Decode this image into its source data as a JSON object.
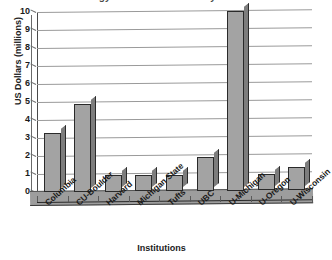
{
  "figure": {
    "title_sliver": "Technology Transfer Revenue by Institution",
    "background_color": "#ffffff",
    "bar_fill_color": "#a3a3a3",
    "bar_side_color": "#7d7d7d",
    "bar_outline_color": "#2a2a2a",
    "gridline_color": "#9a9a9a",
    "floor_color": "#9d9d9d"
  },
  "chart_data": {
    "type": "bar",
    "title": "",
    "xlabel": "Institutions",
    "ylabel": "US Dollars (millions)",
    "categories": [
      "Columbia",
      "CU-Boulder",
      "Harvard",
      "Michigan State",
      "Tufts",
      "UBC",
      "U-Michigan",
      "U-Oregon",
      "U-Wisconsin"
    ],
    "values": [
      3.3,
      4.9,
      0.9,
      0.9,
      0.9,
      1.9,
      10.0,
      0.9,
      1.3
    ],
    "ylim": [
      0,
      10
    ],
    "yticks": [
      0,
      1,
      2,
      3,
      4,
      5,
      6,
      7,
      8,
      9,
      10
    ],
    "ytick_labels": [
      "0",
      "1",
      "2",
      "3",
      "4",
      "5",
      "6",
      "7",
      "8",
      "9",
      "10"
    ],
    "grid": true,
    "grid_axis": "y",
    "legend": false,
    "style_3d": true
  }
}
